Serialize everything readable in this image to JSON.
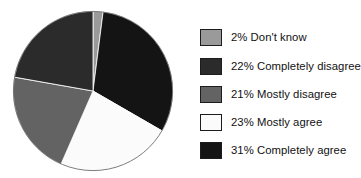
{
  "chart_data": {
    "type": "pie",
    "title": "",
    "subtitle": "",
    "xlabel": "",
    "ylabel": "",
    "grid": false,
    "legend_position": "right",
    "start_angle_deg": 0,
    "direction": "clockwise",
    "units": "percent",
    "total": 99,
    "categories": [
      "Don't know",
      "Completely agree",
      "Mostly agree",
      "Mostly disagree",
      "Completely disagree"
    ],
    "values": [
      2,
      31,
      23,
      21,
      22
    ],
    "slices": [
      {
        "label": "Don't know",
        "value": 2,
        "value_text": "2%",
        "color": "#9a9a9a",
        "legend_index": 0
      },
      {
        "label": "Completely agree",
        "value": 31,
        "value_text": "31%",
        "color": "#141414",
        "legend_index": 4
      },
      {
        "label": "Mostly agree",
        "value": 23,
        "value_text": "23%",
        "color": "#fbfbfb",
        "legend_index": 3
      },
      {
        "label": "Mostly disagree",
        "value": 21,
        "value_text": "21%",
        "color": "#636363",
        "legend_index": 2
      },
      {
        "label": "Completely disagree",
        "value": 22,
        "value_text": "22%",
        "color": "#2b2b2b",
        "legend_index": 1
      }
    ],
    "annotations": []
  },
  "legend": {
    "items": [
      {
        "text": "2% Don't know",
        "percent": "2%",
        "label": "Don't know",
        "color": "#9a9a9a"
      },
      {
        "text": "22% Completely disagree",
        "percent": "22%",
        "label": "Completely disagree",
        "color": "#2b2b2b"
      },
      {
        "text": "21% Mostly disagree",
        "percent": "21%",
        "label": "Mostly disagree",
        "color": "#636363"
      },
      {
        "text": "23% Mostly agree",
        "percent": "23%",
        "label": "Mostly agree",
        "color": "#fbfbfb"
      },
      {
        "text": "31% Completely agree",
        "percent": "31%",
        "label": "Completely agree",
        "color": "#141414"
      }
    ]
  },
  "colors": {
    "background": "#ffffff",
    "text": "#111111",
    "outline": "#1c1c1c",
    "pie_outline": "#5a5a5a"
  }
}
